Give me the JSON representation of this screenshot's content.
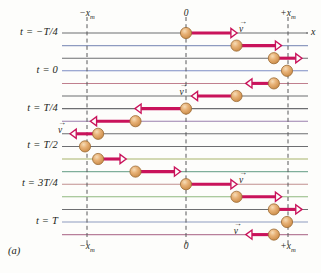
{
  "figure": {
    "panel_label": "(a)",
    "x_axis_name": "x",
    "background": "#fdfdfb"
  },
  "colors": {
    "ball_fill": "#e0a263",
    "ball_highlight": "#f2cfa0",
    "ball_edge": "#9c6b33",
    "arrow": "#c9135b",
    "axis_line": "#6d6e71",
    "dash_line": "#58595b",
    "text": "#231f20"
  },
  "axis": {
    "ticks_top": [
      {
        "label": "−x",
        "sub": "m",
        "x": 87
      },
      {
        "label": "0",
        "sub": "",
        "x": 186
      },
      {
        "label": "+x",
        "sub": "m",
        "x": 288
      }
    ],
    "ticks_bottom": [
      {
        "label": "−x",
        "sub": "m",
        "x": 87
      },
      {
        "label": "0",
        "sub": "",
        "x": 186
      },
      {
        "label": "+x",
        "sub": "m",
        "x": 288
      }
    ],
    "x_min_px": 62,
    "x_max_px": 308,
    "amplitude_px": 101
  },
  "time_labels": [
    {
      "text": "t = −T/4",
      "row": 0
    },
    {
      "text": "t = 0",
      "row": 3
    },
    {
      "text": "t = T/4",
      "row": 6
    },
    {
      "text": "t = T/2",
      "row": 9
    },
    {
      "text": "t = 3T/4",
      "row": 12
    },
    {
      "text": "t = T",
      "row": 15
    }
  ],
  "velocity_symbol": "v",
  "chart_data": {
    "type": "scatter",
    "xlabel": "x",
    "ylabel": "time",
    "xlim": [
      -1,
      1
    ],
    "grid": true,
    "legend": "none",
    "x_tick_labels": [
      "-x_m",
      "0",
      "+x_m"
    ],
    "x_tick_values": [
      -1,
      0,
      1
    ],
    "rows": [
      {
        "row": 0,
        "time": "-T/4",
        "x": 0.0,
        "v_dir": "right",
        "v_mag": 1.0,
        "labeled": true,
        "line_color": "#6d6e71"
      },
      {
        "row": 1,
        "time": "",
        "x": 0.5,
        "v_dir": "right",
        "v_mag": 0.87,
        "labeled": false,
        "line_color": "#8e9bc0"
      },
      {
        "row": 2,
        "time": "",
        "x": 0.87,
        "v_dir": "right",
        "v_mag": 0.5,
        "labeled": false,
        "line_color": "#6d6e71"
      },
      {
        "row": 3,
        "time": "0",
        "x": 1.0,
        "v_dir": "none",
        "v_mag": 0.0,
        "labeled": false,
        "line_color": "#7d8cc4"
      },
      {
        "row": 4,
        "time": "",
        "x": 0.87,
        "v_dir": "left",
        "v_mag": 0.5,
        "labeled": false,
        "line_color": "#c07f8e"
      },
      {
        "row": 5,
        "time": "",
        "x": 0.5,
        "v_dir": "left",
        "v_mag": 0.87,
        "labeled": true,
        "line_color": "#6d6e71"
      },
      {
        "row": 6,
        "time": "T/4",
        "x": 0.0,
        "v_dir": "left",
        "v_mag": 1.0,
        "labeled": false,
        "line_color": "#6d6e71"
      },
      {
        "row": 7,
        "time": "",
        "x": -0.5,
        "v_dir": "left",
        "v_mag": 0.87,
        "labeled": false,
        "line_color": "#9a7fae"
      },
      {
        "row": 8,
        "time": "",
        "x": -0.87,
        "v_dir": "left",
        "v_mag": 0.5,
        "labeled": true,
        "line_color": "#6d6e71"
      },
      {
        "row": 9,
        "time": "T/2",
        "x": -1.0,
        "v_dir": "none",
        "v_mag": 0.0,
        "labeled": false,
        "line_color": "#6d6e71"
      },
      {
        "row": 10,
        "time": "",
        "x": -0.87,
        "v_dir": "right",
        "v_mag": 0.5,
        "labeled": false,
        "line_color": "#a8b36a"
      },
      {
        "row": 11,
        "time": "",
        "x": -0.5,
        "v_dir": "right",
        "v_mag": 0.87,
        "labeled": false,
        "line_color": "#7fae9a"
      },
      {
        "row": 12,
        "time": "3T/4",
        "x": 0.0,
        "v_dir": "right",
        "v_mag": 1.0,
        "labeled": true,
        "line_color": "#c08f8f"
      },
      {
        "row": 13,
        "time": "",
        "x": 0.5,
        "v_dir": "right",
        "v_mag": 0.87,
        "labeled": false,
        "line_color": "#8fb87f"
      },
      {
        "row": 14,
        "time": "",
        "x": 0.87,
        "v_dir": "right",
        "v_mag": 0.5,
        "labeled": false,
        "line_color": "#6d6e71"
      },
      {
        "row": 15,
        "time": "T",
        "x": 1.0,
        "v_dir": "none",
        "v_mag": 0.0,
        "labeled": false,
        "line_color": "#8e9bc0"
      },
      {
        "row": 16,
        "time": "",
        "x": 0.87,
        "v_dir": "left",
        "v_mag": 0.5,
        "labeled": true,
        "line_color": "#b87f9a"
      }
    ]
  }
}
